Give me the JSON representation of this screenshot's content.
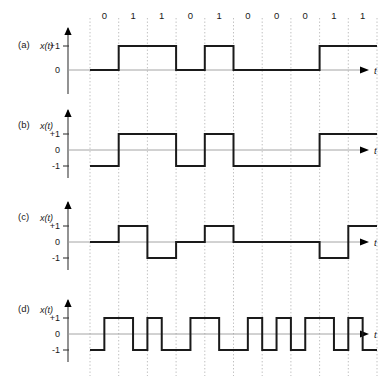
{
  "figure": {
    "bit_sequence": [
      "0",
      "1",
      "1",
      "0",
      "1",
      "0",
      "0",
      "0",
      "1",
      "1"
    ],
    "time_axis_label": "t",
    "signal_axis_label": "x(t)",
    "colors": {
      "wave": "#1a1a1a",
      "gridline": "#b9b9b9",
      "zeroline": "#9a9a9a",
      "axis": "#3a3a3a",
      "background": "#ffffff"
    },
    "geometry": {
      "y_axis_x": 68,
      "first_gridline_x": 90,
      "bit_width": 28.7,
      "t_axis_end_x": 372,
      "bit_count": 10
    }
  },
  "chart_data": [
    {
      "type": "line",
      "panel": "a",
      "panel_label": "(a)",
      "title": "Unipolar NRZ",
      "ylabel": "x(t)",
      "xlabel": "t",
      "ylim": [
        -1,
        1
      ],
      "ytick_labels": [
        "+1",
        "0"
      ],
      "ytick_values": [
        1,
        0
      ],
      "grid": true,
      "legend": "none",
      "categories": [
        "0",
        "1",
        "1",
        "0",
        "1",
        "0",
        "0",
        "0",
        "1",
        "1"
      ],
      "values": [
        0,
        1,
        1,
        0,
        1,
        0,
        0,
        0,
        1,
        1
      ],
      "baseline_y": 0,
      "axis_top": 28,
      "axis_height": 52,
      "level_px": {
        "p1": 46,
        "zero": 70,
        "m1": 94
      }
    },
    {
      "type": "line",
      "panel": "b",
      "panel_label": "(b)",
      "title": "Polar NRZ",
      "ylabel": "x(t)",
      "xlabel": "t",
      "ylim": [
        -1,
        1
      ],
      "ytick_labels": [
        "+1",
        "0",
        "-1"
      ],
      "ytick_values": [
        1,
        0,
        -1
      ],
      "grid": true,
      "legend": "none",
      "categories": [
        "0",
        "1",
        "1",
        "0",
        "1",
        "0",
        "0",
        "0",
        "1",
        "1"
      ],
      "values": [
        -1,
        1,
        1,
        -1,
        1,
        -1,
        -1,
        -1,
        1,
        1
      ],
      "baseline_y": 0,
      "axis_top": 110,
      "axis_height": 60,
      "level_px": {
        "p1": 134,
        "zero": 150,
        "m1": 166
      }
    },
    {
      "type": "line",
      "panel": "c",
      "panel_label": "(c)",
      "title": "Bipolar AMI",
      "ylabel": "x(t)",
      "xlabel": "t",
      "ylim": [
        -1,
        1
      ],
      "ytick_labels": [
        "+1",
        "0",
        "-1"
      ],
      "ytick_values": [
        1,
        0,
        -1
      ],
      "grid": true,
      "legend": "none",
      "categories": [
        "0",
        "1",
        "1",
        "0",
        "1",
        "0",
        "0",
        "0",
        "1",
        "1"
      ],
      "values": [
        0,
        1,
        -1,
        0,
        1,
        0,
        0,
        0,
        -1,
        1
      ],
      "baseline_y": 0,
      "axis_top": 202,
      "axis_height": 60,
      "level_px": {
        "p1": 226,
        "zero": 242,
        "m1": 258
      }
    },
    {
      "type": "line",
      "panel": "d",
      "panel_label": "(d)",
      "title": "Manchester",
      "ylabel": "x(t)",
      "xlabel": "t",
      "ylim": [
        -1,
        1
      ],
      "ytick_labels": [
        "+1",
        "0",
        "-1"
      ],
      "ytick_values": [
        1,
        0,
        -1
      ],
      "grid": true,
      "legend": "none",
      "categories": [
        "0",
        "1",
        "1",
        "0",
        "1",
        "0",
        "0",
        "0",
        "1",
        "1"
      ],
      "half_bit_values": [
        [
          -1,
          1
        ],
        [
          1,
          -1
        ],
        [
          1,
          -1
        ],
        [
          -1,
          1
        ],
        [
          1,
          -1
        ],
        [
          -1,
          1
        ],
        [
          -1,
          1
        ],
        [
          -1,
          1
        ],
        [
          1,
          -1
        ],
        [
          1,
          -1
        ]
      ],
      "baseline_y": 0,
      "axis_top": 300,
      "axis_height": 60,
      "level_px": {
        "p1": 318,
        "zero": 334,
        "m1": 350
      }
    }
  ]
}
